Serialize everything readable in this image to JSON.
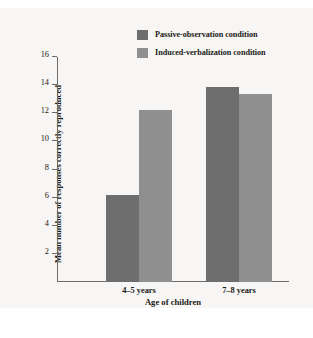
{
  "chart_data": {
    "type": "bar",
    "title": "",
    "xlabel": "Age of children",
    "ylabel": "Mean number of responses correctly reproduced",
    "categories": [
      "4–5 years",
      "7–8 years"
    ],
    "series": [
      {
        "name": "Passive-observation condition",
        "color": "#6e6e6e",
        "values": [
          6.2,
          13.9
        ]
      },
      {
        "name": "Induced-verbalization condition",
        "color": "#8f8f8f",
        "values": [
          12.2,
          13.4
        ]
      }
    ],
    "ylim": [
      0,
      16
    ],
    "yticks": [
      2,
      4,
      6,
      8,
      10,
      12,
      14,
      16
    ],
    "ytick_labels": [
      "2",
      "4",
      "6",
      "8",
      "10",
      "12",
      "14",
      "16"
    ],
    "grid": false,
    "legend_position": "top-right"
  },
  "colors": {
    "background": "#f7f6f4",
    "page": "#ffffff",
    "axis": "#6b6b6b",
    "text": "#1d1a17",
    "series_1": "#6e6e6e",
    "series_2": "#8f8f8f"
  }
}
